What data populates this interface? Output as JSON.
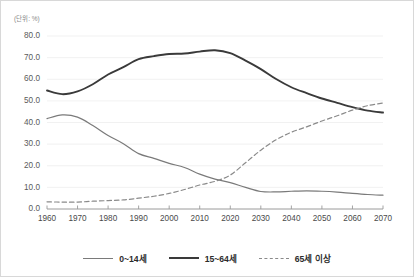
{
  "unit_label": "(단위: %)",
  "legend": {
    "position": "bottom",
    "items": [
      {
        "label": "0~14세",
        "color": "#7a7a7a",
        "style": "solid",
        "width": 1.2
      },
      {
        "label": "15~64세",
        "color": "#3a3a3a",
        "style": "solid",
        "width": 1.9
      },
      {
        "label": "65세 이상",
        "color": "#8a8a8a",
        "style": "dashed",
        "width": 1.2
      }
    ]
  },
  "chart_data": {
    "type": "line",
    "title": "",
    "subtitle": "",
    "xlabel": "",
    "ylabel": "",
    "unit": "%",
    "grid": true,
    "legend_position": "bottom",
    "xlim": [
      1960,
      2070
    ],
    "ylim": [
      0,
      80
    ],
    "yticks": [
      0,
      10,
      20,
      30,
      40,
      50,
      60,
      70,
      80
    ],
    "ytick_labels": [
      "0.0",
      "10.0",
      "20.0",
      "30.0",
      "40.0",
      "50.0",
      "60.0",
      "70.0",
      "80.0"
    ],
    "xticks": [
      1960,
      1970,
      1980,
      1990,
      2000,
      2010,
      2020,
      2030,
      2040,
      2050,
      2060,
      2070
    ],
    "xtick_labels": [
      "1960",
      "1970",
      "1980",
      "1990",
      "2000",
      "2010",
      "2020",
      "2030",
      "2040",
      "2050",
      "2060",
      "2070"
    ],
    "x": [
      1960,
      1965,
      1970,
      1975,
      1980,
      1985,
      1990,
      1995,
      2000,
      2005,
      2010,
      2015,
      2020,
      2025,
      2030,
      2035,
      2040,
      2045,
      2050,
      2055,
      2060,
      2065,
      2070
    ],
    "series": [
      {
        "name": "0~14세",
        "color": "#7a7a7a",
        "style": "solid",
        "values": [
          41.8,
          43.5,
          42.5,
          38.6,
          34.0,
          30.2,
          25.6,
          23.4,
          21.1,
          19.2,
          16.1,
          13.8,
          12.2,
          10.0,
          8.1,
          7.9,
          8.2,
          8.4,
          8.2,
          7.8,
          7.2,
          6.7,
          6.4
        ]
      },
      {
        "name": "15~64세",
        "color": "#3a3a3a",
        "style": "solid",
        "values": [
          54.8,
          53.1,
          54.4,
          57.7,
          62.2,
          65.6,
          69.3,
          70.7,
          71.7,
          71.9,
          72.8,
          73.4,
          72.1,
          68.6,
          64.7,
          60.1,
          56.3,
          53.6,
          51.1,
          49.1,
          47.1,
          45.5,
          44.6
        ]
      },
      {
        "name": "65세 이상",
        "color": "#8a8a8a",
        "style": "dashed",
        "values": [
          3.3,
          3.2,
          3.2,
          3.6,
          3.9,
          4.2,
          5.0,
          5.9,
          7.2,
          9.0,
          11.1,
          12.8,
          15.7,
          21.4,
          27.2,
          32.0,
          35.5,
          38.0,
          40.7,
          43.1,
          45.7,
          47.8,
          49.0
        ]
      }
    ],
    "annotations": []
  }
}
